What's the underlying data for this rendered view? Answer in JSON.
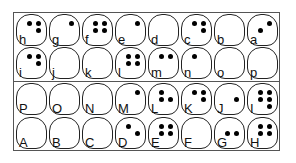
{
  "chart_title": "",
  "layout": {
    "columns": 8,
    "rows": 4
  },
  "frame_color": "#555555",
  "sections": [
    {
      "name": "lowercase",
      "rows": [
        [
          {
            "letter": "h",
            "dots": [
              1,
              4,
              5
            ]
          },
          {
            "letter": "g",
            "dots": [
              4
            ]
          },
          {
            "letter": "f",
            "dots": [
              1,
              2,
              4,
              5
            ]
          },
          {
            "letter": "e",
            "dots": [
              4
            ]
          },
          {
            "letter": "d",
            "dots": []
          },
          {
            "letter": "c",
            "dots": [
              1,
              4,
              5
            ]
          },
          {
            "letter": "b",
            "dots": []
          },
          {
            "letter": "a",
            "dots": [
              2,
              4
            ]
          }
        ],
        [
          {
            "letter": "i",
            "dots": [
              1,
              4,
              5
            ]
          },
          {
            "letter": "j",
            "dots": []
          },
          {
            "letter": "k",
            "dots": []
          },
          {
            "letter": "l",
            "dots": [
              1,
              2,
              4,
              5
            ]
          },
          {
            "letter": "m",
            "dots": [
              1,
              4
            ]
          },
          {
            "letter": "n",
            "dots": [
              1
            ]
          },
          {
            "letter": "o",
            "dots": []
          },
          {
            "letter": "p",
            "dots": []
          }
        ]
      ]
    },
    {
      "name": "uppercase",
      "rows": [
        [
          {
            "letter": "P",
            "dots": []
          },
          {
            "letter": "O",
            "dots": []
          },
          {
            "letter": "N",
            "dots": []
          },
          {
            "letter": "M",
            "dots": [
              4
            ]
          },
          {
            "letter": "L",
            "dots": [
              1,
              2,
              5
            ]
          },
          {
            "letter": "K",
            "dots": [
              1,
              4,
              5
            ]
          },
          {
            "letter": "J",
            "dots": [
              5
            ]
          },
          {
            "letter": "I",
            "dots": [
              1,
              2,
              4,
              5,
              6
            ]
          }
        ],
        [
          {
            "letter": "A",
            "dots": []
          },
          {
            "letter": "B",
            "dots": []
          },
          {
            "letter": "C",
            "dots": []
          },
          {
            "letter": "D",
            "dots": [
              1,
              5
            ]
          },
          {
            "letter": "E",
            "dots": [
              1,
              2,
              4,
              5
            ]
          },
          {
            "letter": "F",
            "dots": []
          },
          {
            "letter": "G",
            "dots": [
              2,
              5
            ]
          },
          {
            "letter": "H",
            "dots": [
              1,
              2,
              4,
              5
            ]
          }
        ]
      ]
    }
  ]
}
